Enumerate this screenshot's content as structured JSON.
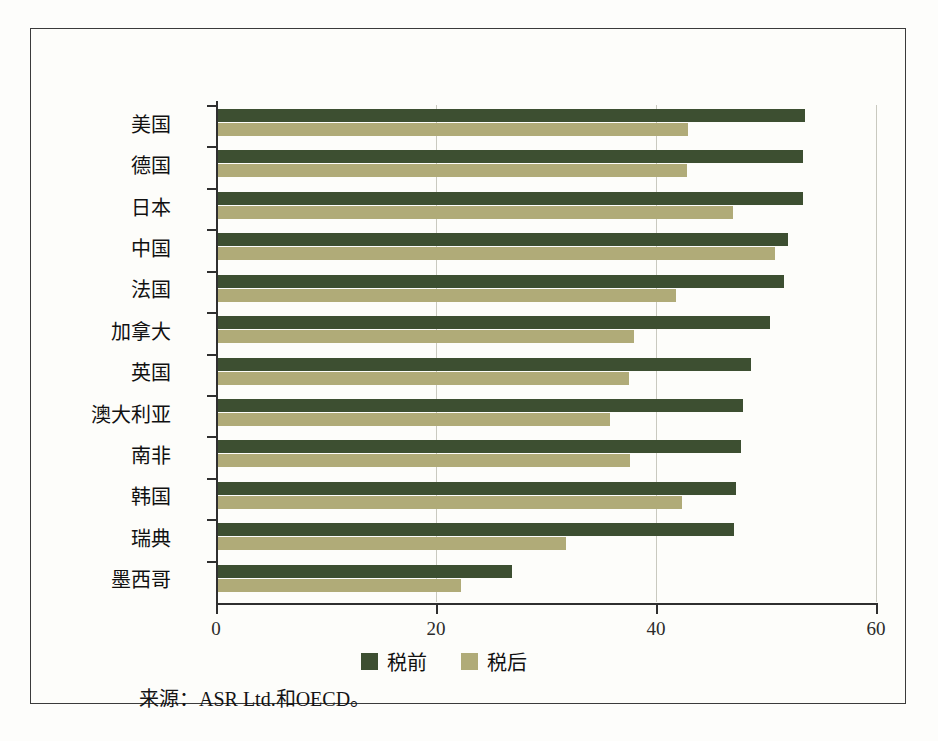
{
  "chart_data": {
    "type": "bar",
    "orientation": "horizontal",
    "title": "",
    "xlabel": "",
    "ylabel": "",
    "xlim": [
      0,
      60
    ],
    "xticks": [
      0,
      20,
      40,
      60
    ],
    "xticklabels": [
      "0",
      "20",
      "40",
      "60"
    ],
    "grid": true,
    "legend_position": "bottom-center",
    "categories": [
      "美国",
      "德国",
      "日本",
      "中国",
      "法国",
      "加拿大",
      "英国",
      "澳大利亚",
      "南非",
      "韩国",
      "瑞典",
      "墨西哥"
    ],
    "series": [
      {
        "name": "税前",
        "color": "#3d4f31",
        "values": [
          53.5,
          53.4,
          53.4,
          52.0,
          51.6,
          50.4,
          48.6,
          47.9,
          47.7,
          47.3,
          47.1,
          26.9
        ]
      },
      {
        "name": "税后",
        "color": "#b0ab78",
        "values": [
          42.9,
          42.8,
          47.0,
          50.8,
          41.8,
          38.0,
          37.5,
          35.8,
          37.6,
          42.4,
          31.8,
          22.3
        ]
      }
    ],
    "source_note": "来源：ASR Ltd.和OECD。"
  },
  "legend": {
    "items": [
      {
        "label": "税前",
        "color": "#3d4f31"
      },
      {
        "label": "税后",
        "color": "#b0ab78"
      }
    ]
  },
  "axis": {
    "x_tick_labels": [
      "0",
      "20",
      "40",
      "60"
    ]
  },
  "footer": {
    "source": "来源：ASR Ltd.和OECD。"
  }
}
